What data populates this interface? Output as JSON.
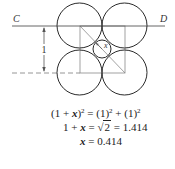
{
  "diagram": {
    "labels": {
      "left_point": "C",
      "right_point": "D",
      "dimension": "1",
      "small_radius": "x"
    },
    "colors": {
      "stroke": "#2a2a2a",
      "construction": "#8a8a8a",
      "background": "#ffffff"
    }
  },
  "equations": {
    "line1": {
      "lhs_base": "(1 + ",
      "lhs_var": "x",
      "lhs_close": ")",
      "lhs_exp": "2",
      "eq": " = (1)",
      "rhs1_exp": "2",
      "plus": " + (1)",
      "rhs2_exp": "2"
    },
    "line2": {
      "prefix": "1 + ",
      "var": "x",
      "eq": " = ",
      "radical": "√",
      "radicand": "2",
      "result": " = 1.414"
    },
    "line3": {
      "var": "x",
      "result": " = 0.414"
    }
  }
}
